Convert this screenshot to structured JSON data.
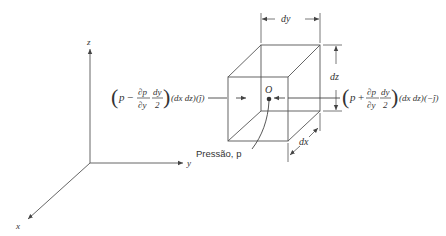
{
  "diagram": {
    "axes": {
      "z_label": "z",
      "y_label": "y",
      "x_label": "x"
    },
    "cube": {
      "center_label": "O",
      "pressure_label": "Pressão, p",
      "dimensions": {
        "dy": "dy",
        "dz": "dz",
        "dx": "dx"
      }
    },
    "left_force": {
      "open": "(",
      "p": "p",
      "sign": "−",
      "frac1_num": "∂p",
      "frac1_den": "∂y",
      "frac2_num": "dy",
      "frac2_den": "2",
      "close": ")",
      "area": "(dx dz)",
      "direction": "(ĵ)"
    },
    "right_force": {
      "open": "(",
      "p": "p",
      "sign": "+",
      "frac1_num": "∂p",
      "frac1_den": "∂y",
      "frac2_num": "dy",
      "frac2_den": "2",
      "close": ")",
      "area": "(dx dz)",
      "direction": "(−ĵ)"
    },
    "colors": {
      "line": "#555555",
      "text": "#333333",
      "background": "#ffffff"
    }
  }
}
